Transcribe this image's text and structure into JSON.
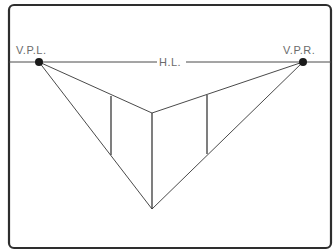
{
  "diagram": {
    "type": "two-point-perspective",
    "labels": {
      "vpl": "V.P.L.",
      "vpr": "V.P.R.",
      "horizon": "H.L."
    },
    "points": {
      "vpl": {
        "x": 39,
        "y": 62
      },
      "vpr": {
        "x": 303,
        "y": 62
      },
      "top_vertex": {
        "x": 152,
        "y": 113
      },
      "bottom_vertex": {
        "x": 152,
        "y": 209
      }
    },
    "verticals": [
      {
        "x": 111,
        "y1": 96,
        "y2": 155
      },
      {
        "x": 152,
        "y1": 113,
        "y2": 209
      },
      {
        "x": 207,
        "y1": 95,
        "y2": 154
      }
    ],
    "colors": {
      "line": "#4a4a4a",
      "frame": "#2e2e2e",
      "point": "#1a1a1a",
      "label": "#6a6a6a"
    }
  }
}
